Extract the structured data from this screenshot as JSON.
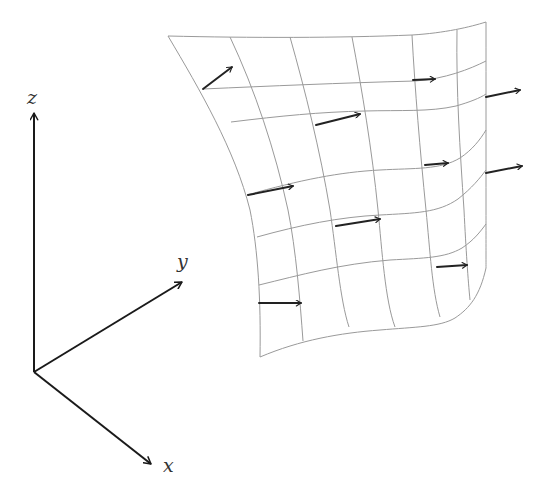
{
  "diagram": {
    "axes": {
      "origin": [
        34,
        372
      ],
      "labels": {
        "z": "z",
        "y": "y",
        "x": "x"
      }
    },
    "surface": {
      "rows": 7,
      "columns": 7,
      "grid_color": "#9a9a9a"
    },
    "vectors": {
      "count": 11,
      "color": "#222222"
    }
  }
}
